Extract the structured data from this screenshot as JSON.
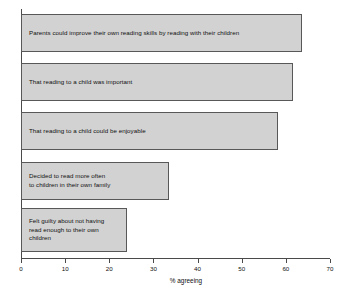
{
  "chart_data": {
    "type": "bar",
    "orientation": "horizontal",
    "title": "",
    "xlabel": "% agreeing",
    "ylabel": "",
    "xlim": [
      0,
      70
    ],
    "xticks": [
      0,
      10,
      20,
      30,
      40,
      50,
      60,
      70
    ],
    "xtick_labels": [
      "0",
      "10",
      "20",
      "30",
      "40",
      "50",
      "60",
      "70"
    ],
    "grid": false,
    "legend": null,
    "categories": [
      "Parents could improve their own reading skills by reading with their children",
      "That reading to a child was important",
      "That reading to a child could be enjoyable",
      "Decided to read more often\nto children in their own family",
      "Felt guilty about not having\nread enough to their own\nchildren"
    ],
    "values": [
      63.7,
      61.7,
      58.3,
      33.6,
      24.0
    ],
    "bar_fill_color": "#d2d2d2",
    "bar_border_color": "#585858",
    "axis_color": "#4a4a4a",
    "background_color": "#ffffff"
  },
  "bars": [
    {
      "label": "Parents could improve their own reading skills by reading with their children",
      "value": 63.7,
      "top": 14,
      "height": 38
    },
    {
      "label": "Decided to read more often\nto children in their own family",
      "value": 33.6,
      "top": 162,
      "height": 38
    },
    {
      "label": "That reading to a child was important",
      "value": 61.7,
      "top": 63,
      "height": 38
    },
    {
      "label": "That reading to a child could be enjoyable",
      "value": 58.3,
      "top": 112,
      "height": 38
    },
    {
      "label": "Felt guilty about not having\nread enough to their own\nchildren",
      "value": 24.0,
      "top": 208,
      "height": 44
    }
  ],
  "axis": {
    "title": "% agreeing",
    "ticks": [
      {
        "label": "0",
        "value": 0
      },
      {
        "label": "10",
        "value": 10
      },
      {
        "label": "20",
        "value": 20
      },
      {
        "label": "30",
        "value": 30
      },
      {
        "label": "40",
        "value": 40
      },
      {
        "label": "50",
        "value": 50
      },
      {
        "label": "60",
        "value": 60
      },
      {
        "label": "70",
        "value": 70
      }
    ]
  }
}
